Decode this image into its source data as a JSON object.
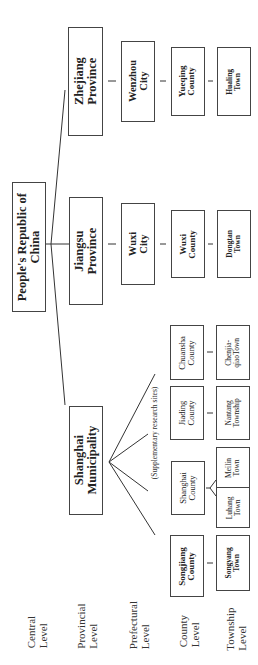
{
  "diagram": {
    "type": "hierarchy",
    "orientation": "rotated-90-ccw",
    "levels": [
      {
        "line1": "Central",
        "line2": "Level"
      },
      {
        "line1": "Provincial",
        "line2": "Level"
      },
      {
        "line1": "Prefectural",
        "line2": "Level"
      },
      {
        "line1": "County",
        "line2": "Level"
      },
      {
        "line1": "Township",
        "line2": "Level"
      }
    ],
    "root": {
      "line1": "People's Republic of",
      "line2": "China"
    },
    "provinces": {
      "zhejiang": {
        "line1": "Zhejiang",
        "line2": "Province"
      },
      "jiangsu": {
        "line1": "Jiangsu",
        "line2": "Province"
      },
      "shanghai": {
        "line1": "Shanghai",
        "line2": "Municipality"
      }
    },
    "prefectures": {
      "wenzhou": {
        "line1": "Wenzhou",
        "line2": "City"
      },
      "wuxi": {
        "line1": "Wuxi",
        "line2": "City"
      }
    },
    "counties": {
      "yueqing": {
        "line1": "Yueqing",
        "line2": "County"
      },
      "wuxi": {
        "line1": "Wuxi",
        "line2": "County"
      },
      "chuansha": {
        "line1": "Chuansha",
        "line2": "County"
      },
      "jiading": {
        "line1": "Jiading",
        "line2": "County"
      },
      "shanghai": {
        "line1": "Shanghai",
        "line2": "County"
      },
      "songjiang": {
        "line1": "Songjiang",
        "line2": "County"
      }
    },
    "townships": {
      "hualing": {
        "line1": "Hualing",
        "line2": "Town"
      },
      "dongtan": {
        "line1": "Dongtan",
        "line2": "Town"
      },
      "chenjiaqiao": {
        "line1": "Chenjia-",
        "line2": "qiaoTown"
      },
      "nantang": {
        "line1": "Nantang",
        "line2": "Township"
      },
      "meilin": {
        "line1": "Meilin",
        "line2": "Town"
      },
      "luhang": {
        "line1": "Luhang",
        "line2": "Town"
      },
      "songyang": {
        "line1": "Songyang",
        "line2": "Town"
      }
    },
    "annotation": "(Supplementary research sites)"
  }
}
